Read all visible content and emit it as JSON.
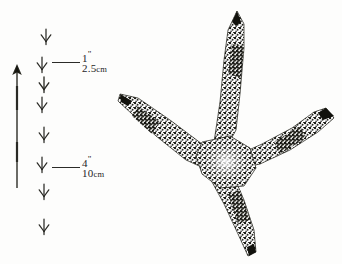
{
  "figure": {
    "ink_color": "#24241f",
    "paper_color": "#fdfdfc"
  },
  "scale_bars": [
    {
      "id": "scale-small",
      "imperial_value": "1",
      "imperial_unit": "\"",
      "metric_value": "2.5",
      "metric_unit": "cm",
      "y": 62
    },
    {
      "id": "scale-large",
      "imperial_value": "4",
      "imperial_unit": "\"",
      "metric_value": "10",
      "metric_unit": "cm",
      "y": 167
    }
  ],
  "stride_arrow": {
    "name": "stride-direction-arrow",
    "direction": "up",
    "top": 64,
    "bottom": 188
  },
  "trail_tracks": {
    "count": 8,
    "offsets": [
      {
        "top": 10,
        "left": 8
      },
      {
        "top": 38,
        "left": 4
      },
      {
        "top": 58,
        "left": 6
      },
      {
        "top": 78,
        "left": 4
      },
      {
        "top": 108,
        "left": 6
      },
      {
        "top": 138,
        "left": 4
      },
      {
        "top": 165,
        "left": 6
      },
      {
        "top": 200,
        "left": 6
      }
    ]
  },
  "main_track": {
    "name": "bird-footprint",
    "toe_count": 4,
    "toes": [
      "front-toe-middle",
      "front-toe-left",
      "front-toe-right",
      "hind-toe"
    ]
  }
}
